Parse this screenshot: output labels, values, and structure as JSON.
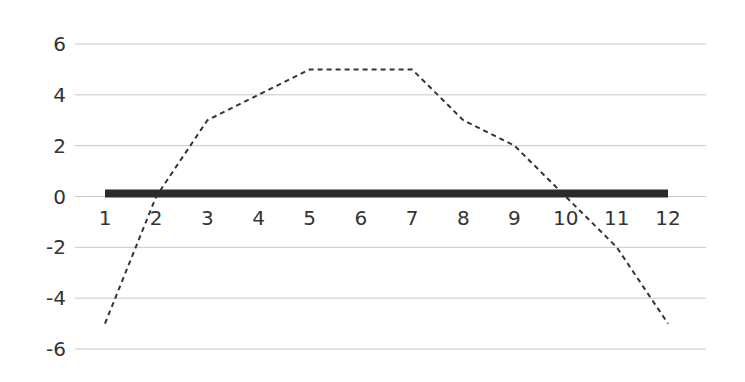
{
  "chart_data": {
    "type": "line",
    "title": "",
    "xlabel": "",
    "ylabel": "",
    "categories": [
      "1",
      "2",
      "3",
      "4",
      "5",
      "6",
      "7",
      "8",
      "9",
      "10",
      "11",
      "12"
    ],
    "ylim": [
      -6,
      6
    ],
    "yticks": [
      "6",
      "4",
      "2",
      "0",
      "-2",
      "-4",
      "-6"
    ],
    "grid": true,
    "legend": null,
    "series": [
      {
        "name": "dashed series",
        "style": "dashed",
        "color": "#333333",
        "values": [
          -5,
          0,
          3,
          4,
          5,
          5,
          5,
          3,
          2,
          0,
          -2,
          -5
        ]
      },
      {
        "name": "solid series",
        "style": "thick-solid",
        "color": "#2b2b2b",
        "values": [
          0,
          0,
          0,
          0,
          0,
          0,
          0,
          0,
          0,
          0,
          0,
          0
        ]
      }
    ]
  },
  "colors": {
    "grid": "#c8c8c8",
    "text": "#333333",
    "line": "#2b2b2b"
  }
}
